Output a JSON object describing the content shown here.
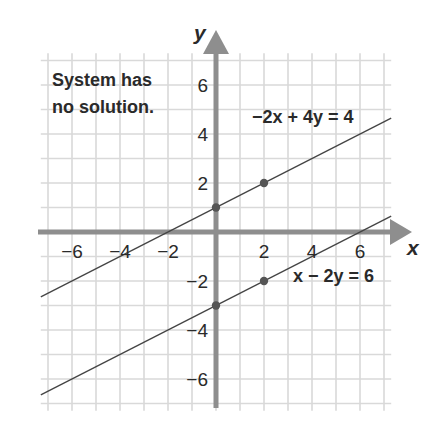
{
  "chart_data": {
    "type": "line",
    "title": "",
    "annotation": "System has no solution.",
    "annotation_lines": [
      "System has",
      "no solution."
    ],
    "xlabel": "x",
    "ylabel": "y",
    "xlim": [
      -7.5,
      7.5
    ],
    "ylim": [
      -7.5,
      7.5
    ],
    "grid": true,
    "x_ticks": [
      -6,
      -4,
      -2,
      2,
      4,
      6
    ],
    "y_ticks": [
      6,
      4,
      2,
      -2,
      -4,
      -6
    ],
    "x_tick_labels": [
      "−6",
      "−4",
      "−2",
      "2",
      "4",
      "6"
    ],
    "y_tick_labels": [
      "6",
      "4",
      "2",
      "−2",
      "−4",
      "−6"
    ],
    "series": [
      {
        "name": "−2x + 4y = 4",
        "slope": 0.5,
        "intercept": 1,
        "x": [
          -7.3,
          7.3
        ],
        "y": [
          -2.65,
          4.65
        ],
        "points": [
          [
            0,
            1
          ],
          [
            2,
            2
          ]
        ],
        "color": "#444444"
      },
      {
        "name": "x − 2y = 6",
        "slope": 0.5,
        "intercept": -3,
        "x": [
          -7.3,
          7.3
        ],
        "y": [
          -6.65,
          0.65
        ],
        "points": [
          [
            0,
            -3
          ],
          [
            2,
            -2
          ]
        ],
        "color": "#444444"
      }
    ],
    "colors": {
      "grid": "#d9d9d9",
      "axis": "#8e8e8e",
      "line": "#444444",
      "point": "#555555",
      "text": "#2a2a2a"
    }
  }
}
